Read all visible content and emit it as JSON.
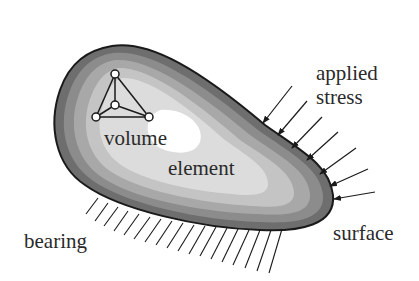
{
  "diagram": {
    "type": "solid body with volume element, applied stress and bearing surface",
    "labels": {
      "volume": "volume",
      "element": "element",
      "applied": "applied",
      "stress": "stress",
      "bearing": "bearing",
      "surface": "surface"
    },
    "colors": {
      "outline": "#1a1a1a",
      "shade_outer": "#6e6e6e",
      "shade_2": "#8c8c8c",
      "shade_3": "#a8a8a8",
      "shade_4": "#c4c4c4",
      "shade_5": "#dcdcdc",
      "core": "#ffffff",
      "text": "#2a2a2a"
    },
    "tetrahedron_nodes": [
      {
        "x": 115,
        "y": 74
      },
      {
        "x": 96,
        "y": 117
      },
      {
        "x": 115,
        "y": 105
      },
      {
        "x": 149,
        "y": 117
      }
    ],
    "stress_arrow_count": 7,
    "bearing_hatch_count": 18
  }
}
